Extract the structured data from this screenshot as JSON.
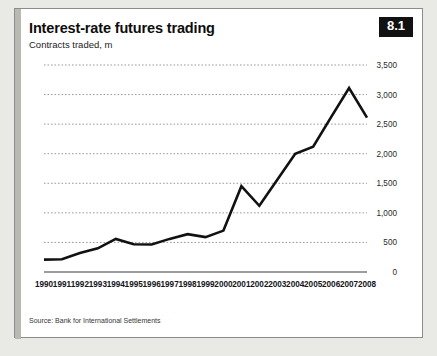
{
  "card": {
    "title": "Interest-rate futures trading",
    "subtitle": "Contracts traded, m",
    "badge": "8.1",
    "source": "Source: Bank for International Settlements",
    "accent_color": "#b9b9b4",
    "badge_bg": "#111111",
    "line_color": "#111111",
    "grid_color": "#9a9a9a",
    "background": "#ffffff",
    "page_background": "#e9e9e6"
  },
  "chart_data": {
    "type": "line",
    "title": "Interest-rate futures trading",
    "subtitle": "Contracts traded, m",
    "xlabel": "",
    "ylabel": "Contracts traded, m",
    "ylim": [
      0,
      3500
    ],
    "yticks": [
      0,
      500,
      1000,
      1500,
      2000,
      2500,
      3000,
      3500
    ],
    "ytick_labels": [
      "0",
      "500",
      "1,000",
      "1,500",
      "2,000",
      "2,500",
      "3,000",
      "3,500"
    ],
    "grid": true,
    "legend": false,
    "categories": [
      "1990",
      "1991",
      "1992",
      "1993",
      "1994",
      "1995",
      "1996",
      "1997",
      "1998",
      "1999",
      "2000",
      "2001",
      "2002",
      "2003",
      "2004",
      "2005",
      "2006",
      "2007",
      "2008"
    ],
    "values": [
      210,
      215,
      320,
      400,
      560,
      470,
      465,
      560,
      640,
      590,
      700,
      1450,
      1120,
      1560,
      2000,
      2120,
      2620,
      3110,
      2610
    ]
  }
}
